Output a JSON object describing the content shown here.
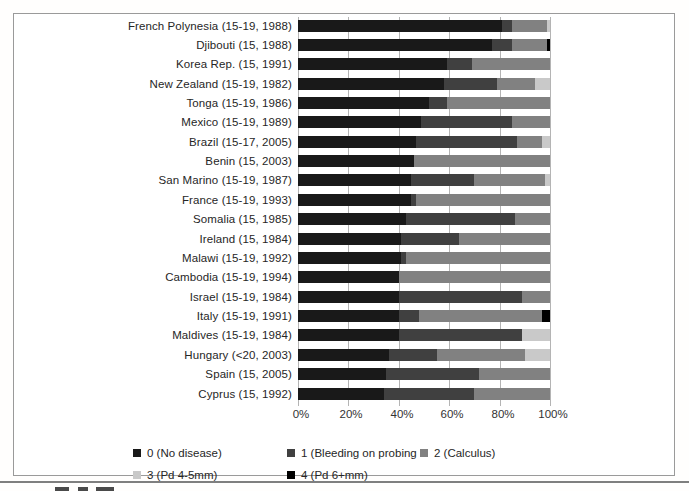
{
  "chart_data": {
    "type": "bar",
    "orientation": "horizontal",
    "stacked": true,
    "unit": "%",
    "xlim": [
      0,
      100
    ],
    "x_ticks": [
      "0%",
      "20%",
      "40%",
      "60%",
      "80%",
      "100%"
    ],
    "grid": "vertical",
    "legend_position": "bottom",
    "categories": [
      "French Polynesia (15-19, 1988)",
      "Djibouti (15, 1988)",
      "Korea Rep. (15, 1991)",
      "New Zealand (15-19, 1982)",
      "Tonga (15-19, 1986)",
      "Mexico (15-19, 1989)",
      "Brazil (15-17, 2005)",
      "Benin (15, 2003)",
      "San Marino (15-19, 1987)",
      "France (15-19, 1993)",
      "Somalia (15, 1985)",
      "Ireland (15, 1984)",
      "Malawi (15-19, 1992)",
      "Cambodia (15-19, 1994)",
      "Israel (15-19, 1984)",
      "Italy (15-19, 1991)",
      "Maldives (15-19, 1984)",
      "Hungary (<20, 2003)",
      "Spain (15, 2005)",
      "Cyprus (15, 1992)"
    ],
    "series": [
      {
        "name": "0 (No disease)",
        "color": "#191919",
        "values": [
          81,
          77,
          59,
          58,
          52,
          49,
          47,
          46,
          45,
          45,
          43,
          41,
          41,
          40,
          40,
          40,
          40,
          36,
          35,
          34
        ]
      },
      {
        "name": "1 (Bleeding on probing",
        "color": "#404040",
        "values": [
          4,
          8,
          10,
          21,
          7,
          36,
          40,
          0,
          25,
          2,
          43,
          23,
          2,
          0,
          49,
          8,
          49,
          19,
          37,
          36
        ]
      },
      {
        "name": "2 (Calculus)",
        "color": "#818181",
        "values": [
          14,
          14,
          31,
          15,
          41,
          15,
          10,
          54,
          28,
          53,
          14,
          36,
          57,
          60,
          11,
          49,
          0,
          35,
          28,
          30
        ]
      },
      {
        "name": "3 (Pd 4-5mm)",
        "color": "#c9c9c9",
        "values": [
          1,
          0,
          0,
          6,
          0,
          0,
          3,
          0,
          2,
          0,
          0,
          0,
          0,
          0,
          0,
          0,
          11,
          10,
          0,
          0
        ]
      },
      {
        "name": "4 (Pd 6+mm)",
        "color": "#000000",
        "values": [
          0,
          1,
          0,
          0,
          0,
          0,
          0,
          0,
          0,
          0,
          0,
          0,
          0,
          0,
          0,
          3,
          0,
          0,
          0,
          0
        ]
      }
    ]
  },
  "colors": {
    "grid": "#b4b4b4",
    "frame_border": "#9a9a9a",
    "text": "#262626",
    "bottom_rule": "#7f7f7f",
    "background": "#ffffff"
  }
}
